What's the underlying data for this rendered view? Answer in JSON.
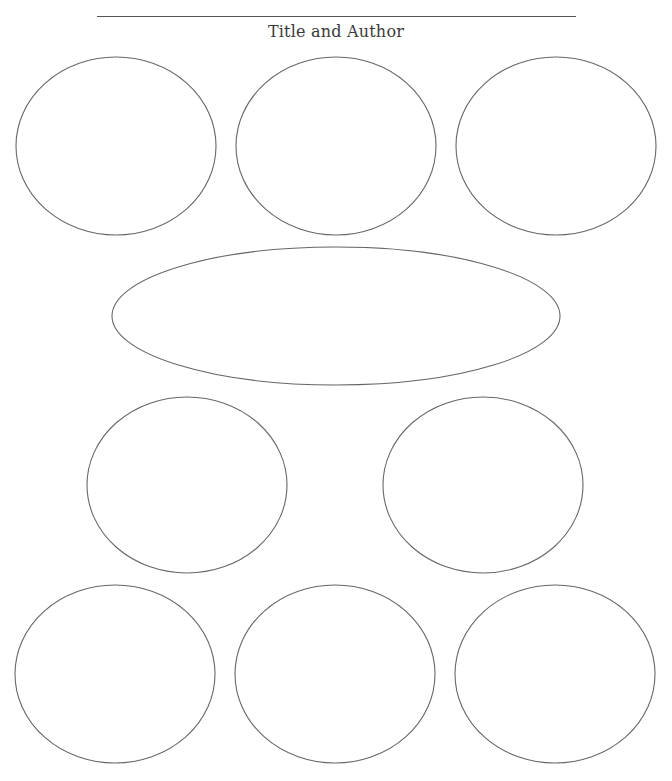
{
  "header": {
    "title_line": "",
    "label": "Title and Author"
  },
  "organizer": {
    "type": "graphic-organizer-bubbles",
    "line_color": "#666666",
    "shapes": [
      {
        "id": "top-left",
        "cx": 116,
        "cy": 146,
        "rx": 100,
        "ry": 89
      },
      {
        "id": "top-center",
        "cx": 336,
        "cy": 146,
        "rx": 100,
        "ry": 89
      },
      {
        "id": "top-right",
        "cx": 556,
        "cy": 146,
        "rx": 100,
        "ry": 89
      },
      {
        "id": "middle-wide",
        "cx": 336,
        "cy": 316,
        "rx": 224,
        "ry": 69
      },
      {
        "id": "middle-left",
        "cx": 187,
        "cy": 485,
        "rx": 100,
        "ry": 88
      },
      {
        "id": "middle-right",
        "cx": 483,
        "cy": 485,
        "rx": 100,
        "ry": 88
      },
      {
        "id": "bottom-left",
        "cx": 115,
        "cy": 674,
        "rx": 100,
        "ry": 89
      },
      {
        "id": "bottom-center",
        "cx": 335,
        "cy": 674,
        "rx": 100,
        "ry": 89
      },
      {
        "id": "bottom-right",
        "cx": 555,
        "cy": 674,
        "rx": 100,
        "ry": 89
      }
    ]
  }
}
